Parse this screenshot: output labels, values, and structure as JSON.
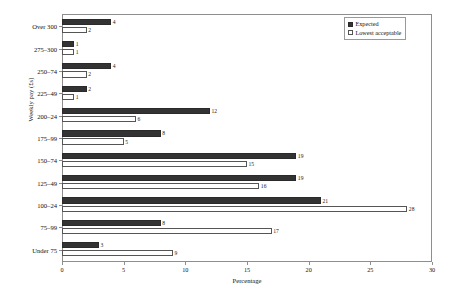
{
  "chart_data": {
    "type": "bar",
    "orientation": "horizontal",
    "title": "",
    "xlabel": "Percentage",
    "ylabel": "Weekly pay (£s)",
    "xlim": [
      0,
      30
    ],
    "xticks": [
      0,
      5,
      10,
      15,
      20,
      25,
      30
    ],
    "grid": false,
    "legend_position": "top-right",
    "categories": [
      "Over 300",
      "275–300",
      "250–74",
      "225–49",
      "200–24",
      "175–99",
      "150–74",
      "125–49",
      "100–24",
      "75–99",
      "Under 75"
    ],
    "series": [
      {
        "name": "Expected",
        "color": "#333333",
        "values": [
          4,
          1,
          4,
          2,
          12,
          8,
          19,
          19,
          21,
          8,
          3
        ]
      },
      {
        "name": "Lowest acceptable",
        "color": "#ffffff",
        "values": [
          2,
          1,
          2,
          1,
          6,
          5,
          15,
          16,
          28,
          17,
          9
        ]
      }
    ]
  },
  "legend": {
    "items": [
      {
        "label": "Expected",
        "swatch": "filled-square-icon"
      },
      {
        "label": "Lowest acceptable",
        "swatch": "open-square-icon"
      }
    ]
  }
}
